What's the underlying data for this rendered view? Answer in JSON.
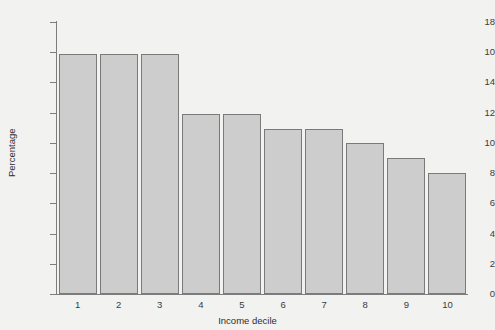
{
  "chart_data": {
    "type": "bar",
    "title": "",
    "xlabel": "Income decile",
    "ylabel": "Percentage",
    "categories": [
      "1",
      "2",
      "3",
      "4",
      "5",
      "6",
      "7",
      "8",
      "9",
      "10"
    ],
    "values": [
      15.9,
      15.9,
      15.9,
      11.9,
      11.9,
      10.9,
      10.9,
      10.0,
      9.0,
      8.0
    ],
    "ylim": [
      0,
      18
    ],
    "xlim_categories": 10,
    "y_ticks": [
      0,
      2,
      4,
      6,
      8,
      10,
      12,
      14,
      16,
      18
    ],
    "y_tick_labels": [
      "0",
      "2",
      "4",
      "6",
      "8",
      "10",
      "12",
      "14",
      "10",
      "18"
    ],
    "grid": false,
    "legend": null,
    "bar_fill_color": "#cdcdcd",
    "bar_edge_color": "#7a7a7a",
    "axis_color": "#7d7d7d",
    "background_color": "#f2f2f0",
    "text_color": "#2e2e2e"
  }
}
